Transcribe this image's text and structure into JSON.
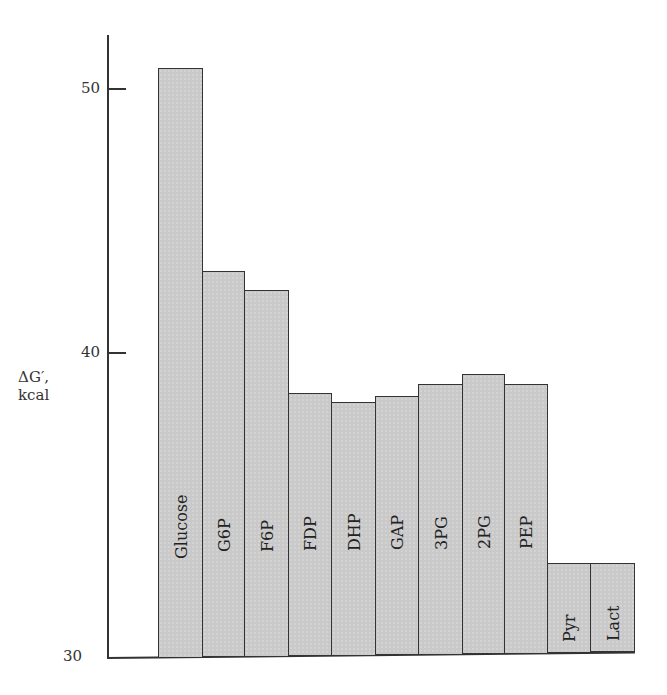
{
  "chart_data": {
    "type": "bar",
    "title": "",
    "xlabel": "",
    "ylabel": "ΔG′, kcal",
    "ylabel_lines": [
      "ΔG′,",
      "kcal"
    ],
    "ylim": [
      30,
      52
    ],
    "yticks": [
      30,
      40,
      50
    ],
    "grid": false,
    "legend": null,
    "categories": [
      "Glucose",
      "G6P",
      "F6P",
      "FDP",
      "DHP",
      "GAP",
      "3PG",
      "2PG",
      "PEP",
      "Pyr",
      "Lact"
    ],
    "values": [
      50.8,
      43.1,
      42.4,
      38.7,
      38.4,
      38.6,
      39.0,
      39.3,
      39.0,
      33.1,
      33.1
    ],
    "bar_color": "#c9c9c9",
    "edge_color": "#333333"
  }
}
